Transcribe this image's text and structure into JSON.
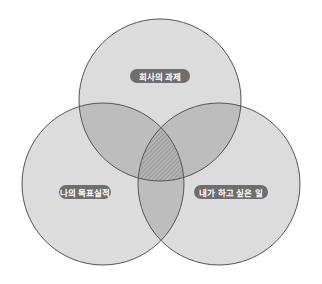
{
  "diagram": {
    "type": "venn",
    "colors": {
      "background": "#ffffff",
      "circle_fill": "#dcdcdc",
      "overlap_fill": "#bdbdbd",
      "center_fill": "#a8a8a8",
      "stroke": "#555555",
      "label_bg": "#6e6e6e",
      "label_text": "#ffffff"
    },
    "circles": [
      {
        "id": "top",
        "cx": 160,
        "cy": 100,
        "r": 81
      },
      {
        "id": "left",
        "cx": 103,
        "cy": 184,
        "r": 81
      },
      {
        "id": "right",
        "cx": 219,
        "cy": 184,
        "r": 81
      }
    ],
    "labels": {
      "top": "회사의 과제",
      "left": "나의 목표실적",
      "right": "내가 하고 싶은 일"
    }
  }
}
